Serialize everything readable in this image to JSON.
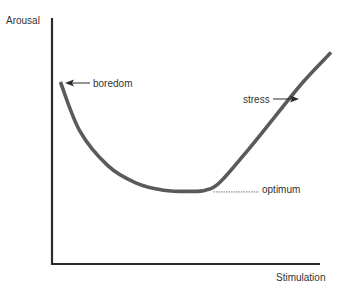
{
  "chart_data": {
    "type": "line",
    "title": "",
    "xlabel": "Stimulation",
    "ylabel": "Arousal",
    "grid": false,
    "legend": "none",
    "x_ticks": [],
    "y_ticks": [],
    "series": [
      {
        "name": "arousal-curve",
        "description": "U-shaped curve: arousal falls from boredom to an optimum at moderate stimulation, then rises steeply toward stress",
        "x": [
          0.03,
          0.1,
          0.2,
          0.3,
          0.4,
          0.5,
          0.55,
          0.6,
          0.7,
          0.8,
          0.9,
          1.0
        ],
        "y": [
          0.74,
          0.54,
          0.4,
          0.33,
          0.3,
          0.295,
          0.3,
          0.33,
          0.46,
          0.6,
          0.74,
          0.86
        ]
      }
    ],
    "xlim": [
      0,
      1.05
    ],
    "ylim": [
      0,
      1.0
    ],
    "annotations": [
      {
        "id": "boredom",
        "text": "boredom",
        "marker": "arrow-left",
        "at": "curve start"
      },
      {
        "id": "stress",
        "text": "stress",
        "marker": "arrow-right",
        "at": "rising branch"
      },
      {
        "id": "optimum",
        "text": "optimum",
        "marker": "dotted-leader",
        "at": "curve minimum"
      }
    ]
  },
  "colors": {
    "axis": "#2a2a2a",
    "curve": "#5a5a5a",
    "text": "#333333",
    "leader": "#777777"
  }
}
